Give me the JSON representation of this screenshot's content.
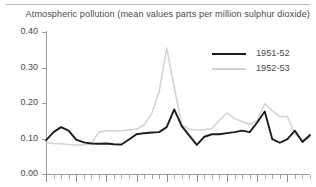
{
  "title": "Atmospheric pollution (mean values parts per million sulphur dioxide)",
  "colors": {
    "series_1951_52": "#1c1c1c",
    "series_1952_53": "#d2d2d2",
    "axis": "#9a9a9a",
    "text": "#4a4a4a",
    "background": "#ffffff"
  },
  "legend": {
    "position": "top-right",
    "entries": [
      {
        "label": "1951-52",
        "color": "#1c1c1c"
      },
      {
        "label": "1952-53",
        "color": "#d2d2d2"
      }
    ]
  },
  "axes": {
    "y_ticks": [
      "0.40",
      "0.30",
      "0.20",
      "0.10",
      "0.00"
    ],
    "y_min": 0.0,
    "y_max": 0.4,
    "x_label": "",
    "y_label": "",
    "grid": false
  },
  "chart_data": {
    "type": "line",
    "title": "Atmospheric pollution (mean values parts per million sulphur dioxide)",
    "xlabel": "",
    "ylabel": "",
    "ylim": [
      0.0,
      0.4
    ],
    "xlim": [
      0,
      35
    ],
    "grid": false,
    "legend_position": "top-right",
    "x": [
      0,
      1,
      2,
      3,
      4,
      5,
      6,
      7,
      8,
      9,
      10,
      11,
      12,
      13,
      14,
      15,
      16,
      17,
      18,
      19,
      20,
      21,
      22,
      23,
      24,
      25,
      26,
      27,
      28,
      29,
      30,
      31,
      32,
      33,
      34,
      35
    ],
    "series": [
      {
        "name": "1951-52",
        "color": "#1c1c1c",
        "values": [
          0.095,
          0.118,
          0.132,
          0.122,
          0.097,
          0.089,
          0.086,
          0.085,
          0.086,
          0.084,
          0.083,
          0.097,
          0.112,
          0.115,
          0.117,
          0.118,
          0.132,
          0.182,
          0.135,
          0.108,
          0.082,
          0.105,
          0.112,
          0.112,
          0.115,
          0.118,
          0.122,
          0.118,
          0.145,
          0.176,
          0.098,
          0.088,
          0.098,
          0.122,
          0.09,
          0.11
        ]
      },
      {
        "name": "1952-53",
        "color": "#d2d2d2",
        "values": [
          0.088,
          0.086,
          0.085,
          0.083,
          0.082,
          0.082,
          0.086,
          0.118,
          0.121,
          0.122,
          0.122,
          0.124,
          0.126,
          0.138,
          0.17,
          0.232,
          0.355,
          0.245,
          0.138,
          0.126,
          0.124,
          0.125,
          0.128,
          0.152,
          0.172,
          0.156,
          0.148,
          0.14,
          0.15,
          0.198,
          0.178,
          0.162,
          0.162,
          0.112,
          0.096,
          0.102
        ]
      }
    ]
  }
}
